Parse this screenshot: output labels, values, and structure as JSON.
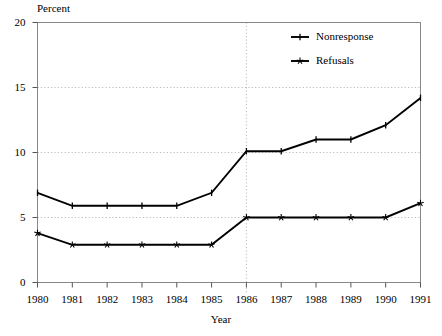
{
  "chart_data": {
    "type": "line",
    "title": "",
    "xlabel": "Year",
    "ylabel": "Percent",
    "x": [
      1980,
      1981,
      1982,
      1983,
      1984,
      1985,
      1986,
      1987,
      1988,
      1989,
      1990,
      1991
    ],
    "categories": [
      "1980",
      "1981",
      "1982",
      "1983",
      "1984",
      "1985",
      "1986",
      "1987",
      "1988",
      "1989",
      "1990",
      "1991"
    ],
    "series": [
      {
        "name": "Nonresponse",
        "marker": "plus-tick",
        "values": [
          6.9,
          5.9,
          5.9,
          5.9,
          5.9,
          6.9,
          10.1,
          10.1,
          11.0,
          11.0,
          12.1,
          14.2
        ]
      },
      {
        "name": "Refusals",
        "marker": "star",
        "values": [
          3.8,
          2.9,
          2.9,
          2.9,
          2.9,
          2.9,
          5.0,
          5.0,
          5.0,
          5.0,
          5.0,
          6.1
        ]
      }
    ],
    "ylim": [
      0,
      20
    ],
    "yticks": [
      0,
      5,
      10,
      15,
      20
    ],
    "ytick_labels": [
      "0",
      "5",
      "10",
      "15",
      "20"
    ],
    "xlim": [
      1980,
      1991
    ],
    "grid": "horizontal-dotted",
    "gridlines_y": [
      5,
      10,
      15
    ],
    "reference_line_x": 1986,
    "legend_position": "top-right-inside",
    "line_color": "#000000",
    "grid_color": "#bbbbbb",
    "frame_color": "#888888",
    "background_color": "#ffffff"
  },
  "legend": {
    "entries": [
      {
        "label": "Nonresponse"
      },
      {
        "label": "Refusals"
      }
    ]
  }
}
